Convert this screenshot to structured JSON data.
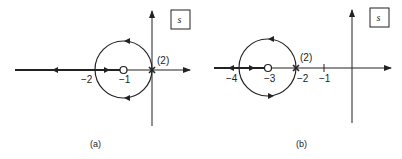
{
  "panels": [
    {
      "id": "a",
      "caption": "(a)",
      "plane_label": "s",
      "multiplicity_label": "(2)",
      "axis_labels": [
        "−2",
        "−1"
      ],
      "zero_at": "−1",
      "double_pole_at": "0",
      "circle": {
        "center": "−1",
        "radius": "1"
      },
      "locus_real_axis": "from −2 to −∞"
    },
    {
      "id": "b",
      "caption": "(b)",
      "plane_label": "s",
      "multiplicity_label": "(2)",
      "axis_labels": [
        "−4",
        "−3",
        "−2",
        "−1"
      ],
      "zero_at": "−3",
      "double_pole_at": "−2",
      "circle": {
        "center": "−3",
        "radius": "1"
      },
      "locus_real_axis": "from −4 to −∞"
    }
  ],
  "colors": {
    "stroke": "#222222",
    "background": "#ffffff"
  }
}
